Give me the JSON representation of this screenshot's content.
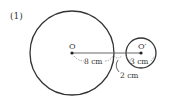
{
  "problem": {
    "number": "(1)"
  },
  "diagram": {
    "big_circle": {
      "center_label": "O",
      "cx": 72,
      "cy": 53,
      "r": 42
    },
    "small_circle": {
      "center_label": "O′",
      "cx": 141,
      "cy": 53,
      "r": 15
    },
    "measurements": {
      "big_radius": "8 cm",
      "small_radius": "3 cm",
      "gap": "2 cm"
    },
    "colors": {
      "stroke": "#333333",
      "dash": "#888888"
    }
  }
}
